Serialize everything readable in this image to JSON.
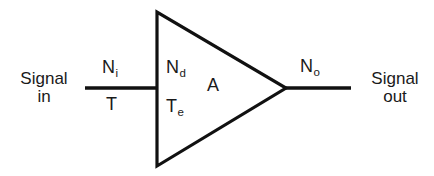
{
  "diagram": {
    "type": "amplifier-noise-block-diagram",
    "background_color": "#ffffff",
    "stroke_color": "#111111",
    "text_color": "#1a1a1a",
    "input_port": {
      "line1": "Signal",
      "line2": "in"
    },
    "output_port": {
      "line1": "Signal",
      "line2": "out"
    },
    "labels": {
      "input_noise": {
        "symbol": "N",
        "subscript": "i"
      },
      "input_temperature": {
        "symbol": "T",
        "subscript": ""
      },
      "device_noise": {
        "symbol": "N",
        "subscript": "d"
      },
      "gain": {
        "symbol": "A",
        "subscript": ""
      },
      "effective_temperature": {
        "symbol": "T",
        "subscript": "e"
      },
      "output_noise": {
        "symbol": "N",
        "subscript": "o"
      }
    },
    "geometry": {
      "triangle_points": "157,12 157,166 286,88",
      "input_line": {
        "x1": 85,
        "y1": 88,
        "x2": 157,
        "y2": 88
      },
      "output_line": {
        "x1": 286,
        "y1": 88,
        "x2": 351,
        "y2": 88
      },
      "stroke_width": 3.2
    }
  }
}
